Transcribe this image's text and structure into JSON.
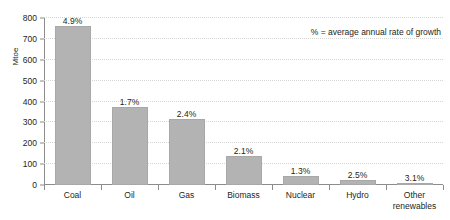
{
  "chart_data": {
    "type": "bar",
    "title": "Global primary energy demand by fuel, 2000-2030",
    "categories": [
      "Coal",
      "Oil",
      "Gas",
      "Biomass",
      "Nuclear",
      "Hydro",
      "Other renewables"
    ],
    "values": [
      760,
      375,
      318,
      140,
      45,
      25,
      10
    ],
    "data_labels": [
      "4.9%",
      "1.7%",
      "2.4%",
      "2.1%",
      "1.3%",
      "2.5%",
      "3.1%"
    ],
    "xlabel": "",
    "ylabel": "Mtoe",
    "ylim": [
      0,
      800
    ],
    "yticks": [
      0,
      100,
      200,
      300,
      400,
      500,
      600,
      700,
      800
    ],
    "ytick_labels": [
      "0",
      "100",
      "200",
      "300",
      "400",
      "500",
      "600",
      "700",
      "800"
    ],
    "annotation": "% = average annual rate of growth",
    "grid": true,
    "legend": false,
    "bar_color": "#b3b3b3",
    "text_color": "#231f20",
    "grid_color": "#d5d5d5",
    "axis_color": "#8c8c8c"
  }
}
